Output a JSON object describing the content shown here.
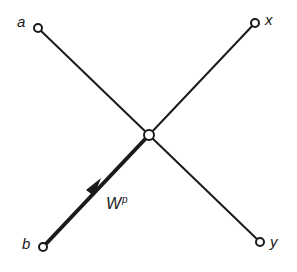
{
  "diagram": {
    "type": "crossing-lines-node",
    "nodes": {
      "a": {
        "label": "a",
        "x": 38,
        "y": 28
      },
      "x": {
        "label": "x",
        "x": 255,
        "y": 23
      },
      "b": {
        "label": "b",
        "x": 43,
        "y": 247
      },
      "y": {
        "label": "y",
        "x": 260,
        "y": 242
      },
      "center": {
        "x": 149,
        "y": 135
      }
    },
    "edges": [
      {
        "from": "a",
        "to": "y"
      },
      {
        "from": "b",
        "to": "x"
      }
    ],
    "highlighted_edge": {
      "from": "b",
      "to": "center",
      "arrow": true
    },
    "weight_label": {
      "base": "W",
      "superscript": "p"
    },
    "colors": {
      "line": "#1a1a1a",
      "background": "#ffffff"
    }
  }
}
